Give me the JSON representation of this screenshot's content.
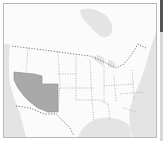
{
  "map": {
    "region": "United States",
    "highlighted_states": [
      "Nevada",
      "Utah",
      "Arizona"
    ],
    "colors": {
      "land": "#fbfbfb",
      "water": "#e4e4e4",
      "highlight": "#a9a9a9",
      "border": "#8a8a8a"
    }
  }
}
